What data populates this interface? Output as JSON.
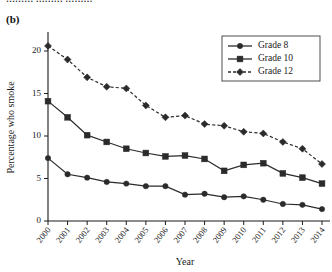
{
  "figure": {
    "panel_label": "(b)",
    "top_cut_text": "……… ……… ………"
  },
  "chart_data": {
    "type": "line",
    "title": "",
    "xlabel": "Year",
    "ylabel": "Percentage who smoke",
    "categories": [
      "2000",
      "2001",
      "2002",
      "2003",
      "2004",
      "2005",
      "2006",
      "2007",
      "2008",
      "2009",
      "2010",
      "2011",
      "2012",
      "2013",
      "2014"
    ],
    "x": [
      2000,
      2001,
      2002,
      2003,
      2004,
      2005,
      2006,
      2007,
      2008,
      2009,
      2010,
      2011,
      2012,
      2013,
      2014
    ],
    "xlim": [
      2000,
      2014
    ],
    "ylim": [
      0,
      22
    ],
    "yticks": [
      0,
      5,
      10,
      15,
      20
    ],
    "ytick_labels": [
      "0",
      "5",
      "10",
      "15",
      "20"
    ],
    "grid": false,
    "legend_position": "top-right",
    "series": [
      {
        "name": "Grade 8",
        "marker": "circle",
        "linestyle": "solid",
        "color": "#2b2b2b",
        "values": [
          7.4,
          5.5,
          5.1,
          4.6,
          4.4,
          4.1,
          4.1,
          3.1,
          3.2,
          2.8,
          2.9,
          2.5,
          2.0,
          1.9,
          1.4
        ]
      },
      {
        "name": "Grade 10",
        "marker": "square",
        "linestyle": "solid",
        "color": "#2b2b2b",
        "values": [
          14.1,
          12.2,
          10.1,
          9.3,
          8.5,
          8.0,
          7.6,
          7.7,
          7.3,
          5.9,
          6.6,
          6.8,
          5.6,
          5.1,
          4.4
        ]
      },
      {
        "name": "Grade 12",
        "marker": "diamond",
        "linestyle": "dashed",
        "color": "#2b2b2b",
        "values": [
          20.6,
          19.0,
          16.9,
          15.8,
          15.6,
          13.6,
          12.2,
          12.4,
          11.4,
          11.2,
          10.5,
          10.3,
          9.3,
          8.5,
          6.7
        ]
      }
    ]
  },
  "legend": {
    "items": [
      {
        "label": "Grade 8"
      },
      {
        "label": "Grade 10"
      },
      {
        "label": "Grade 12"
      }
    ]
  }
}
